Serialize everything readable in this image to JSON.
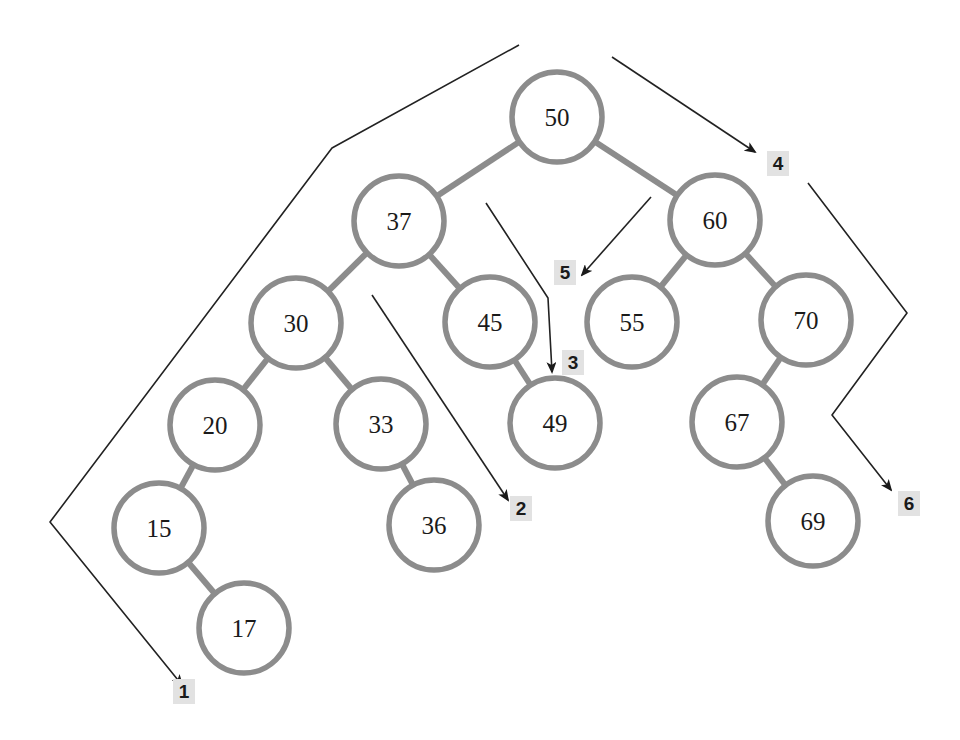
{
  "diagram": {
    "type": "binary-search-tree-traversal",
    "style": {
      "node_stroke": "#8c8c8c",
      "edge_stroke": "#8c8c8c",
      "node_fill": "#ffffff",
      "path_stroke": "#222222",
      "label_bg": "#e2e2e2",
      "node_radius": 45
    },
    "nodes": [
      {
        "id": "50",
        "label": "50",
        "x": 557,
        "y": 117
      },
      {
        "id": "37",
        "label": "37",
        "x": 399,
        "y": 221
      },
      {
        "id": "60",
        "label": "60",
        "x": 715,
        "y": 220
      },
      {
        "id": "30",
        "label": "30",
        "x": 296,
        "y": 323
      },
      {
        "id": "45",
        "label": "45",
        "x": 490,
        "y": 322
      },
      {
        "id": "55",
        "label": "55",
        "x": 632,
        "y": 322
      },
      {
        "id": "70",
        "label": "70",
        "x": 806,
        "y": 320
      },
      {
        "id": "20",
        "label": "20",
        "x": 215,
        "y": 425
      },
      {
        "id": "33",
        "label": "33",
        "x": 381,
        "y": 424
      },
      {
        "id": "49",
        "label": "49",
        "x": 555,
        "y": 423
      },
      {
        "id": "67",
        "label": "67",
        "x": 737,
        "y": 422
      },
      {
        "id": "15",
        "label": "15",
        "x": 159,
        "y": 528
      },
      {
        "id": "36",
        "label": "36",
        "x": 434,
        "y": 525
      },
      {
        "id": "69",
        "label": "69",
        "x": 813,
        "y": 521
      },
      {
        "id": "17",
        "label": "17",
        "x": 244,
        "y": 628
      }
    ],
    "edges": [
      [
        "50",
        "37"
      ],
      [
        "50",
        "60"
      ],
      [
        "37",
        "30"
      ],
      [
        "37",
        "45"
      ],
      [
        "60",
        "55"
      ],
      [
        "60",
        "70"
      ],
      [
        "30",
        "20"
      ],
      [
        "30",
        "33"
      ],
      [
        "45",
        "49"
      ],
      [
        "70",
        "67"
      ],
      [
        "20",
        "15"
      ],
      [
        "33",
        "36"
      ],
      [
        "67",
        "69"
      ],
      [
        "15",
        "17"
      ]
    ],
    "paths": [
      {
        "label": "1",
        "points": [
          [
            519,
            45
          ],
          [
            332,
            148
          ],
          [
            50,
            522
          ],
          [
            182,
            685
          ]
        ],
        "label_pos": [
          185,
          698
        ]
      },
      {
        "label": "2",
        "points": [
          [
            372,
            295
          ],
          [
            508,
            500
          ]
        ],
        "label_pos": [
          522,
          515
        ]
      },
      {
        "label": "3",
        "points": [
          [
            486,
            203
          ],
          [
            548,
            298
          ],
          [
            552,
            372
          ]
        ],
        "label_pos": [
          574,
          369
        ]
      },
      {
        "label": "4",
        "points": [
          [
            612,
            57
          ],
          [
            755,
            152
          ]
        ],
        "label_pos": [
          779,
          170
        ]
      },
      {
        "label": "5",
        "points": [
          [
            651,
            197
          ],
          [
            582,
            275
          ]
        ],
        "label_pos": [
          566,
          279
        ]
      },
      {
        "label": "6",
        "points": [
          [
            808,
            183
          ],
          [
            907,
            313
          ],
          [
            832,
            415
          ],
          [
            891,
            490
          ]
        ],
        "label_pos": [
          910,
          510
        ]
      }
    ]
  }
}
